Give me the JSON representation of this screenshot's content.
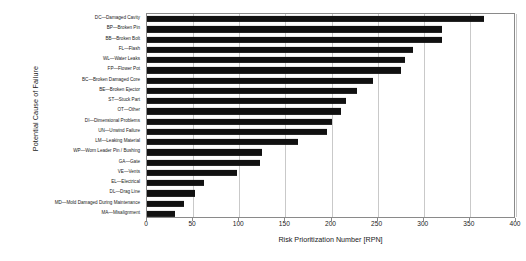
{
  "chart_data": {
    "type": "bar",
    "orientation": "horizontal",
    "title": "",
    "xlabel": "Risk Prioritization Number [RPN]",
    "ylabel": "Potential Cause of Failure",
    "xlim": [
      0,
      400
    ],
    "xticks": [
      0,
      50,
      100,
      150,
      200,
      250,
      300,
      350,
      400
    ],
    "grid": "vertical",
    "legend": "none",
    "bar_color": "#111111",
    "frame_color": "#8a8a8a",
    "categories": [
      "DC—Damaged Cavity",
      "BP—Broken Pin",
      "BB—Broken Bolt",
      "FL—Flash",
      "WL—Water Leaks",
      "FP—Flower Pot",
      "BC—Broken Damaged Core",
      "BE—Broken Ejector",
      "ST—Stuck Part",
      "OT—Other",
      "DI—Dimensional Problems",
      "UN—Unwind Failure",
      "LM—Leaking Material",
      "WP—Worn Leader Pin / Bushing",
      "GA—Gate",
      "VE—Vents",
      "EL—Electrical",
      "DL—Drag Line",
      "MD—Mold Damaged During Maintenance",
      "MA—Misalignment"
    ],
    "values": [
      365,
      320,
      320,
      288,
      280,
      275,
      245,
      228,
      216,
      210,
      200,
      195,
      164,
      125,
      122,
      98,
      62,
      52,
      40,
      30
    ]
  }
}
